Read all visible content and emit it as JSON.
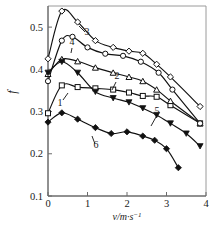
{
  "chart_data": {
    "type": "scatter",
    "title": "",
    "subtitle": "",
    "xlabel": "v/m·s⁻¹",
    "xlabel_base": "v/m·s",
    "xlabel_exponent": "−1",
    "ylabel": "f",
    "xlim": [
      0,
      4
    ],
    "ylim": [
      0.1,
      0.55
    ],
    "xticks": [
      0,
      1,
      2,
      3,
      4
    ],
    "xticklabels": [
      "0",
      "1",
      "2",
      "3",
      "4"
    ],
    "yticks": [
      0.1,
      0.2,
      0.3,
      0.4,
      0.5
    ],
    "yticklabels": [
      "0.1",
      "0.2",
      "0.3",
      "0.4",
      "0.5"
    ],
    "grid": false,
    "legend": "inline-curve-numbers",
    "series": [
      {
        "name": "1",
        "label": "1",
        "marker": "open-square",
        "x": [
          0.0,
          0.35,
          0.75,
          1.2,
          1.65,
          2.05,
          2.4,
          2.75,
          3.1,
          3.85
        ],
        "y": [
          0.296,
          0.362,
          0.358,
          0.355,
          0.352,
          0.345,
          0.337,
          0.335,
          0.315,
          0.272
        ]
      },
      {
        "name": "2",
        "label": "2",
        "marker": "open-triangle-up",
        "x": [
          0.0,
          0.35,
          0.75,
          1.2,
          1.65,
          2.05,
          2.4,
          2.75,
          3.1,
          3.85
        ],
        "y": [
          0.389,
          0.424,
          0.419,
          0.404,
          0.392,
          0.382,
          0.372,
          0.352,
          0.325,
          0.272
        ]
      },
      {
        "name": "3",
        "label": "3",
        "marker": "open-diamond",
        "x": [
          0.0,
          0.35,
          0.75,
          1.2,
          1.65,
          2.05,
          2.4,
          2.75,
          3.1,
          3.85
        ],
        "y": [
          0.425,
          0.538,
          0.512,
          0.468,
          0.452,
          0.443,
          0.438,
          0.412,
          0.382,
          0.312
        ]
      },
      {
        "name": "4",
        "label": "4",
        "marker": "open-circle",
        "x": [
          0.0,
          0.35,
          0.62,
          1.0,
          1.45,
          1.9,
          2.35,
          2.8,
          3.15,
          3.85
        ],
        "y": [
          0.372,
          0.468,
          0.477,
          0.452,
          0.437,
          0.432,
          0.418,
          0.392,
          0.352,
          0.272
        ]
      },
      {
        "name": "5",
        "label": "5",
        "marker": "filled-triangle-down",
        "x": [
          0.0,
          0.35,
          0.75,
          1.2,
          1.65,
          2.05,
          2.4,
          2.75,
          3.1,
          3.5,
          3.85
        ],
        "y": [
          0.392,
          0.418,
          0.392,
          0.347,
          0.332,
          0.322,
          0.308,
          0.292,
          0.272,
          0.248,
          0.218
        ]
      },
      {
        "name": "6",
        "label": "6",
        "marker": "filled-diamond",
        "x": [
          0.0,
          0.35,
          0.75,
          1.2,
          1.6,
          2.0,
          2.4,
          2.7,
          3.0,
          3.3
        ],
        "y": [
          0.275,
          0.297,
          0.282,
          0.262,
          0.248,
          0.252,
          0.242,
          0.232,
          0.212,
          0.167
        ]
      }
    ]
  }
}
